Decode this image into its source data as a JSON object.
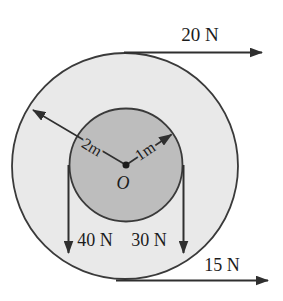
{
  "figure": {
    "type": "mechanics-torque-diagram",
    "forces": {
      "top": {
        "label": "20 N",
        "direction": "right"
      },
      "bottom": {
        "label": "15 N",
        "direction": "right"
      },
      "inner_left": {
        "label": "40 N",
        "direction": "down"
      },
      "inner_right": {
        "label": "30 N",
        "direction": "down"
      }
    },
    "radii": {
      "outer": {
        "label": "2m"
      },
      "inner": {
        "label": "1m"
      }
    },
    "center_label": "O",
    "colors": {
      "outer_disk_fill": "#e9e9e9",
      "inner_disk_fill": "#bdbdbd",
      "line": "#2f2f2f",
      "text": "#1c1c1c",
      "background": "#ffffff"
    }
  }
}
